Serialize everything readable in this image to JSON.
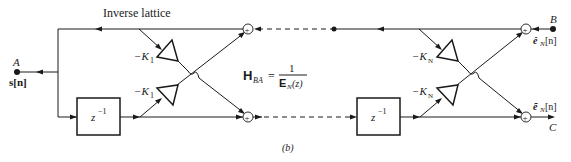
{
  "diagram": {
    "title": "Inverse lattice",
    "caption": "(b)",
    "transfer_function": {
      "lhs_symbol": "H",
      "lhs_subscript": "BA",
      "equals": "=",
      "numerator": "1",
      "denominator_symbol": "E",
      "denominator_subscript": "N",
      "denominator_arg": "(z)"
    },
    "nodes": {
      "A": {
        "label": "A",
        "signal": "s[n]"
      },
      "B": {
        "label": "B",
        "signal_accent": "ê",
        "signal_sub": "N",
        "signal_arg": "[n]"
      },
      "C": {
        "label": "C",
        "signal_accent": "ẽ",
        "signal_sub": "N",
        "signal_arg": "[n]"
      }
    },
    "stages": [
      {
        "name": "stage-1",
        "upper_gain": {
          "prefix": "−K",
          "sub": "1"
        },
        "lower_gain": {
          "prefix": "−K",
          "sub": "1"
        },
        "delay": {
          "base": "z",
          "exp": "−1"
        }
      },
      {
        "name": "stage-N",
        "upper_gain": {
          "prefix": "−K",
          "sub": "N"
        },
        "lower_gain": {
          "prefix": "−K",
          "sub": "N"
        },
        "delay": {
          "base": "z",
          "exp": "−1"
        }
      }
    ],
    "sum_symbol": "+",
    "colors": {
      "line": "#1a1a1a",
      "background": "#ffffff"
    }
  }
}
